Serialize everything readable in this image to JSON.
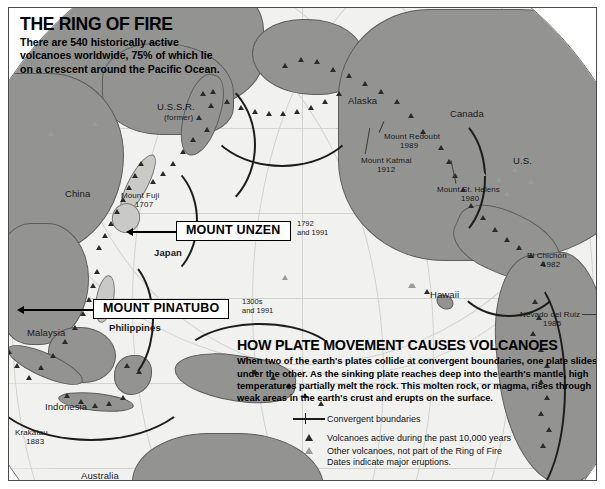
{
  "header": {
    "title": "THE RING OF FIRE",
    "subtitle": "There are 540 historically active volcanoes worldwide, 75% of which lie on a crescent around the Pacific Ocean."
  },
  "callouts": [
    {
      "label": "MOUNT UNZEN",
      "dates": "1792\nand 1991"
    },
    {
      "label": "MOUNT PINATUBO",
      "dates": "1300s\nand 1991"
    }
  ],
  "map_labels": [
    {
      "name": "ussr",
      "text": "U.S.S.R."
    },
    {
      "name": "ussr-former",
      "text": "(former)"
    },
    {
      "name": "alaska",
      "text": "Alaska"
    },
    {
      "name": "canada",
      "text": "Canada"
    },
    {
      "name": "us",
      "text": "U.S."
    },
    {
      "name": "china",
      "text": "China"
    },
    {
      "name": "japan",
      "text": "Japan"
    },
    {
      "name": "philippines",
      "text": "Philippines"
    },
    {
      "name": "malaysia",
      "text": "Malaysia"
    },
    {
      "name": "indonesia",
      "text": "Indonesia"
    },
    {
      "name": "australia",
      "text": "Australia"
    },
    {
      "name": "hawaii",
      "text": "Hawaii"
    }
  ],
  "volcano_labels": [
    {
      "name": "mount-redoubt",
      "text": "Mount Redoubt",
      "year": "1989"
    },
    {
      "name": "mount-katmai",
      "text": "Mount Katmai",
      "year": "1912"
    },
    {
      "name": "mount-st-helens",
      "text": "Mount St. Helens",
      "year": "1980"
    },
    {
      "name": "mount-fuji",
      "text": "Mount Fuji",
      "year": "1707"
    },
    {
      "name": "el-chichon",
      "text": "El Chichón",
      "year": "1982"
    },
    {
      "name": "nevado-del-ruiz",
      "text": "Nevado del Ruiz",
      "year": "1985"
    },
    {
      "name": "krakatau",
      "text": "Krakatau",
      "year": "1883"
    }
  ],
  "panel": {
    "title": "HOW PLATE MOVEMENT CAUSES VOLCANOES",
    "body": "When two of the earth's plates collide at convergent boundaries, one plate slides under the other. As the sinking plate reaches deep into the earth's mantle, high temperatures partially melt the rock. This molten rock, or magma, rises through weak areas in the earth's crust and erupts on the surface."
  },
  "legend": {
    "boundaries": "Convergent boundaries",
    "active": "Volcanoes active during the past 10,000 years",
    "other": "Other volcanoes, not part of the Ring of Fire",
    "note": "Dates indicate major eruptions."
  },
  "colors": {
    "land": "#939391",
    "land_light": "#c9c9c6",
    "ocean": "#f1f1ef",
    "trench": "#1d1d1d",
    "volcano_active": "#2a2a2a",
    "volcano_other": "#9a9a98",
    "frame": "#4a4a4a"
  }
}
